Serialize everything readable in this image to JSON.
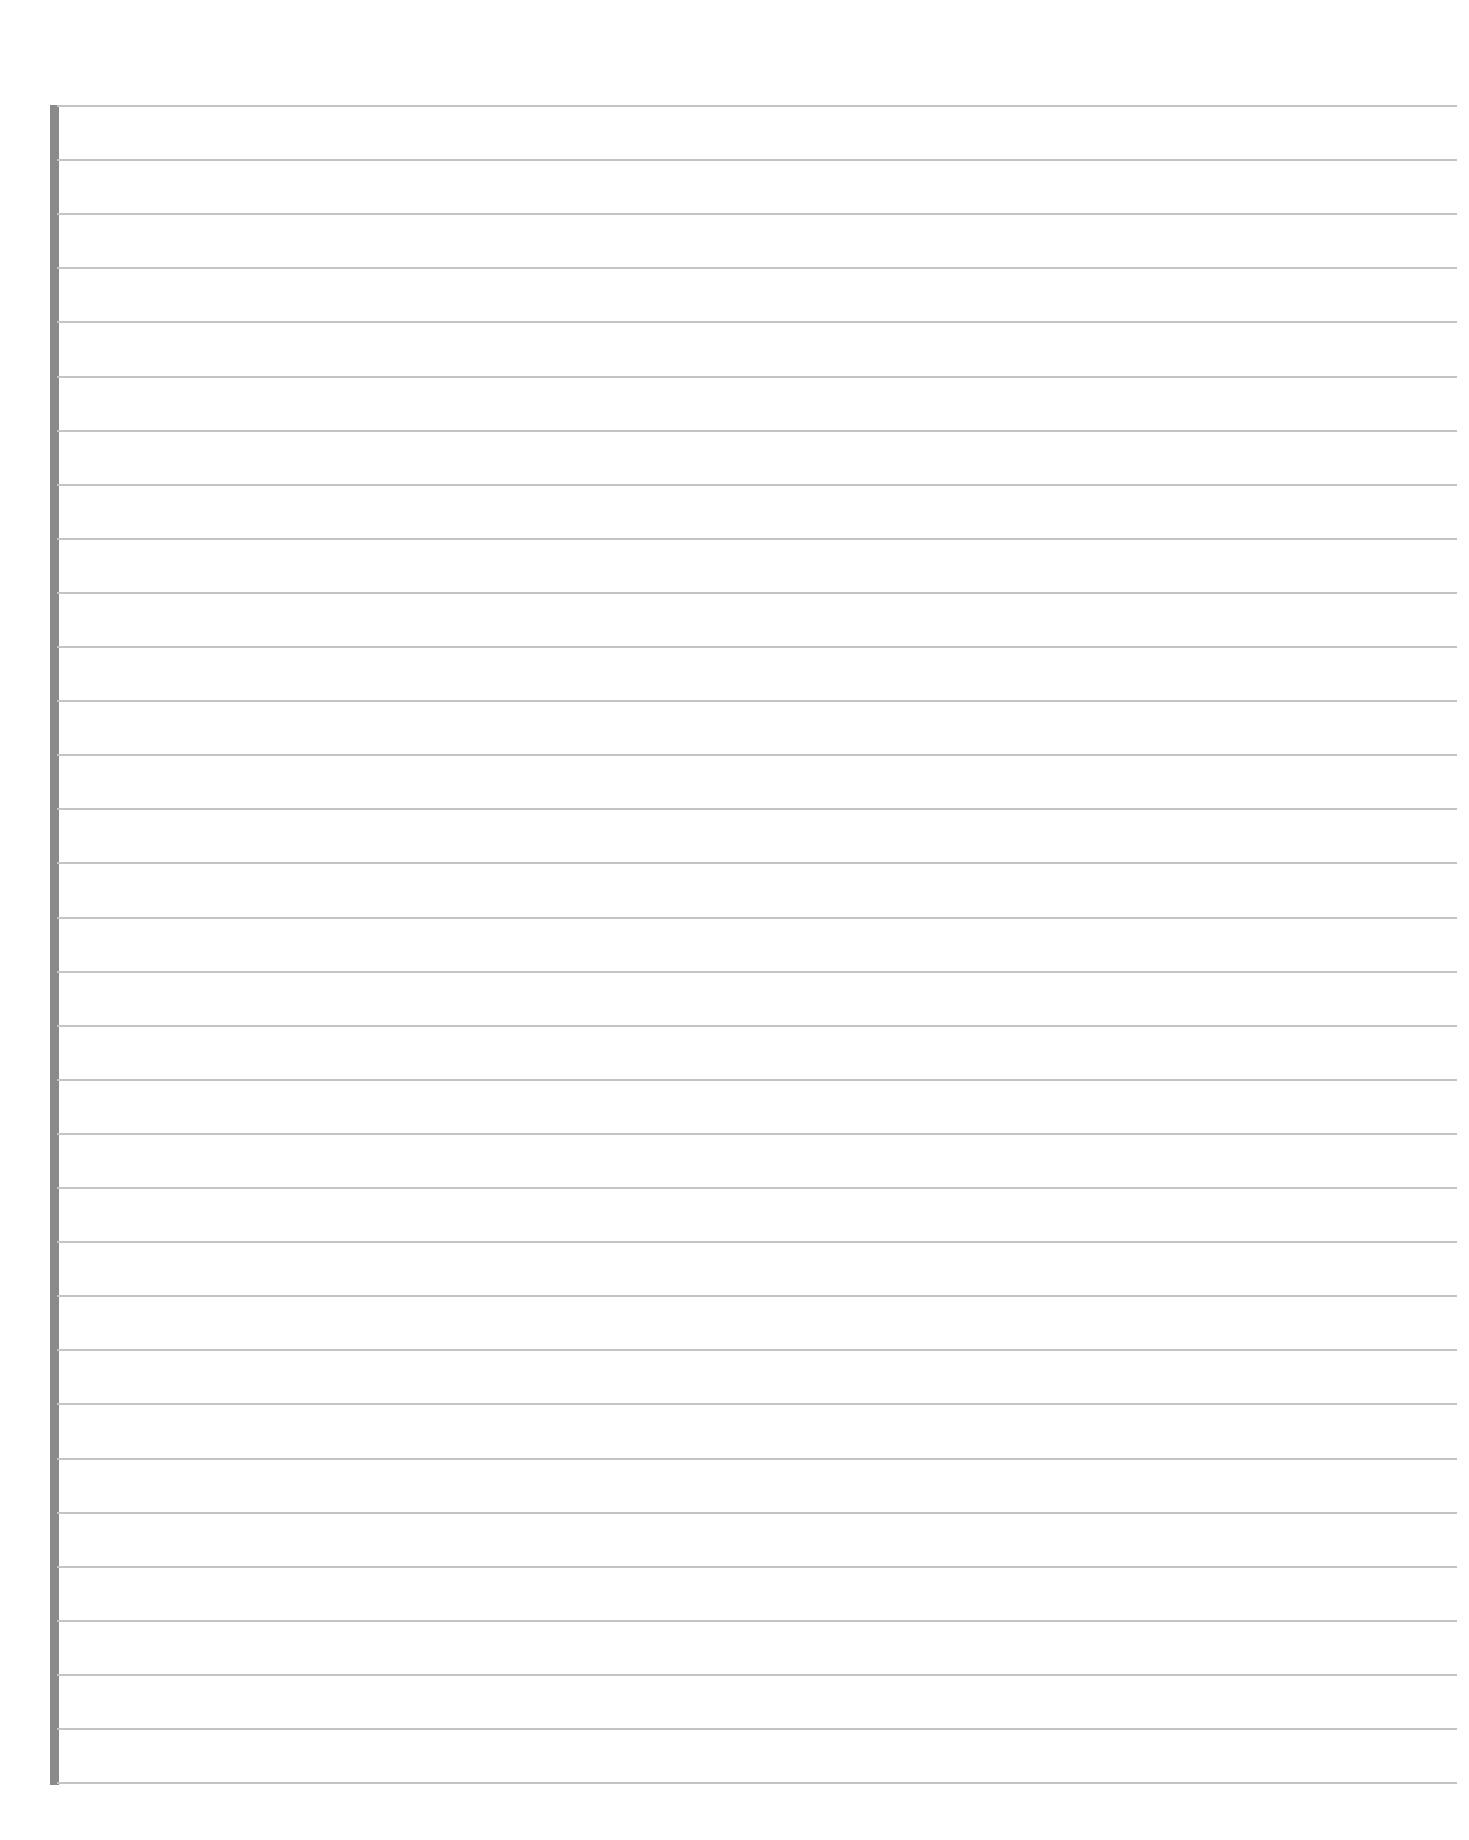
{
  "page": {
    "type": "blank lined paper",
    "text": "",
    "line_count": 32,
    "first_line_y": 106,
    "line_spacing_px": 54.1,
    "line_color": "#c4c4c4",
    "margin_bar_color": "#8a8a8a",
    "background_color": "#ffffff"
  }
}
